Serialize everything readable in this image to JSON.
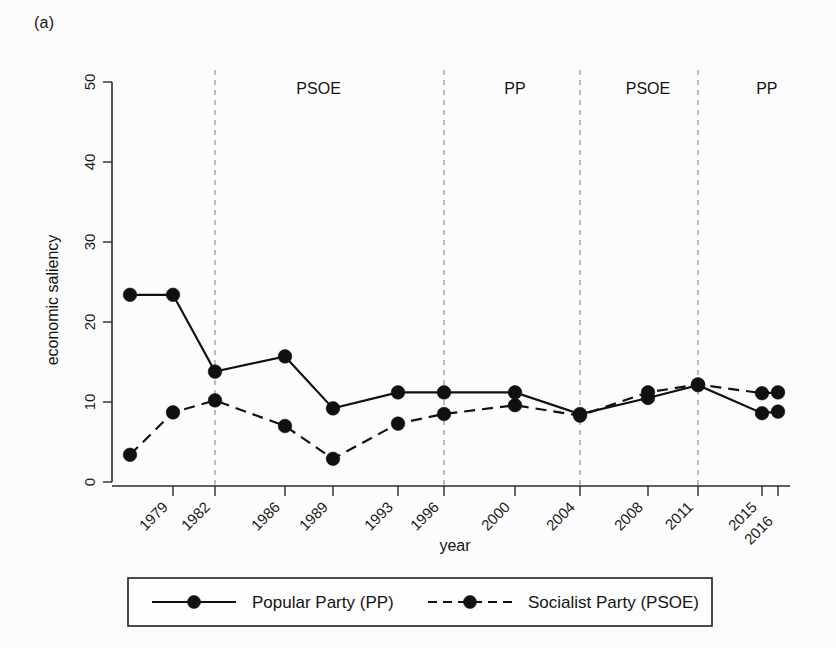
{
  "figure": {
    "panel_label": "(a)"
  },
  "chart_data": {
    "type": "line",
    "title": "",
    "xlabel": "year",
    "ylabel": "economic saliency",
    "xlim": [
      0,
      13
    ],
    "ylim": [
      0,
      50
    ],
    "yticks": [
      0,
      10,
      20,
      30,
      40,
      50
    ],
    "grid": false,
    "legend_position": "below",
    "x": [
      "",
      "1979",
      "1982",
      "1986",
      "1989",
      "1993",
      "1996",
      "2000",
      "2004",
      "2008",
      "2011",
      "2015",
      "2016"
    ],
    "tick_labels": [
      "1979",
      "1982",
      "1986",
      "1989",
      "1993",
      "1996",
      "2000",
      "2004",
      "2008",
      "2011",
      "2015",
      "2016"
    ],
    "series": [
      {
        "name": "Popular Party (PP)",
        "style": "solid",
        "marker": "circle",
        "values": [
          23.4,
          23.4,
          13.8,
          15.7,
          9.2,
          11.2,
          11.2,
          11.2,
          8.5,
          10.5,
          12.1,
          8.6,
          8.8
        ]
      },
      {
        "name": "Socialist Party (PSOE)",
        "style": "dashed",
        "marker": "circle",
        "values": [
          3.4,
          8.7,
          10.2,
          7.0,
          2.9,
          7.3,
          8.5,
          9.6,
          8.3,
          11.2,
          12.2,
          11.1,
          11.2
        ]
      }
    ],
    "annotations": [
      {
        "label": "PSOE",
        "x_index_center": 3.7
      },
      {
        "label": "PP",
        "x_index_center": 7.0
      },
      {
        "label": "PSOE",
        "x_index_center": 9.0
      },
      {
        "label": "PP",
        "x_index_center": 11.3
      }
    ],
    "vertical_markers": [
      {
        "at_year": "1982",
        "x_index": 2
      },
      {
        "at_year": "1996",
        "x_index": 6
      },
      {
        "at_year": "2004",
        "x_index": 8
      },
      {
        "at_year": "2011",
        "x_index": 10
      }
    ]
  },
  "legend": {
    "items": [
      {
        "label": "Popular Party (PP)",
        "style": "solid"
      },
      {
        "label": "Socialist Party (PSOE)",
        "style": "dashed"
      }
    ]
  },
  "colors": {
    "ink": "#111111",
    "gridline": "#9a9a9a",
    "background": "#fbfbfb"
  }
}
